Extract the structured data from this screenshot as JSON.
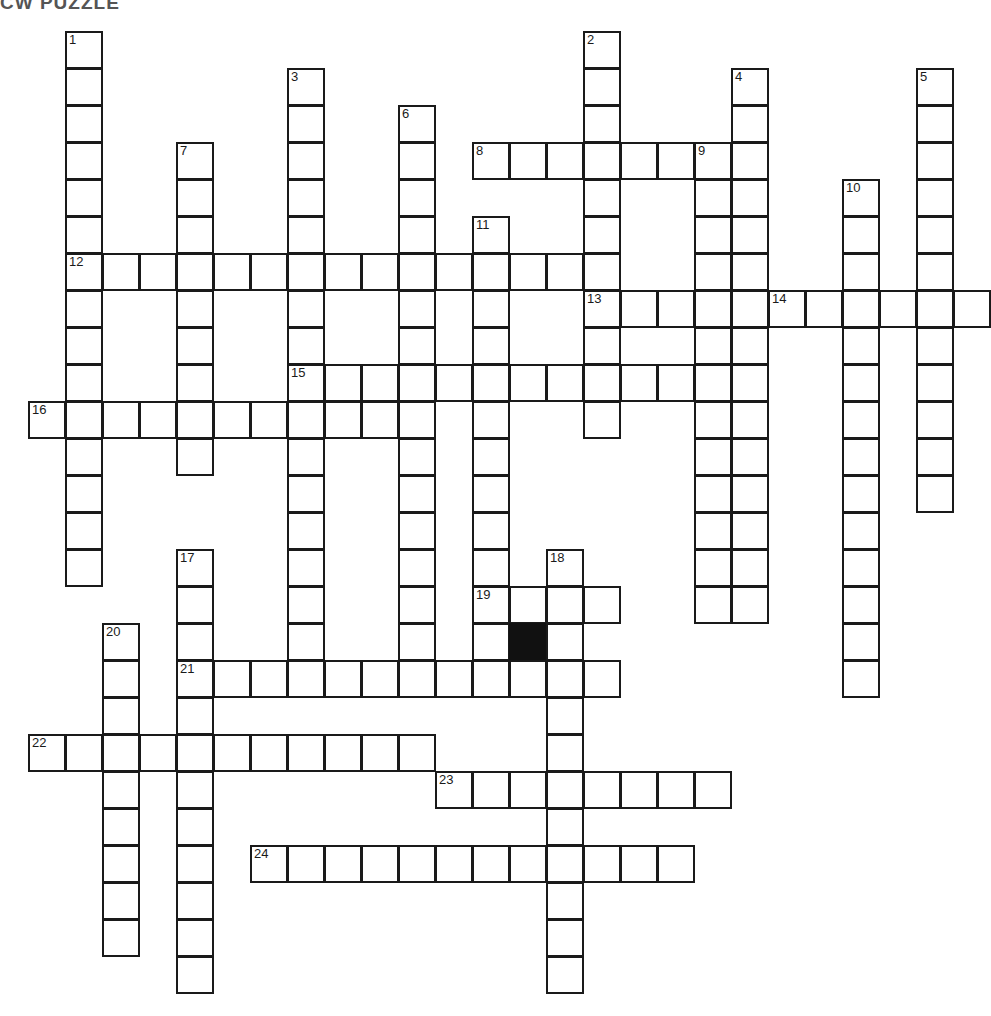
{
  "title": "CW PUZZLE",
  "grid": {
    "origin_x": 28,
    "origin_y": 31,
    "cell_size": 37,
    "cols": 26,
    "rows": 26,
    "border_color": "#1a1a1a",
    "cell_color": "#ffffff",
    "block_color": "#111111"
  },
  "numbers": [
    1,
    2,
    3,
    4,
    5,
    6,
    7,
    8,
    9,
    10,
    11,
    12,
    13,
    14,
    15,
    16,
    17,
    18,
    19,
    20,
    21,
    22,
    23,
    24
  ],
  "entries": [
    {
      "number": 1,
      "direction": "down",
      "col": 1,
      "row": 0,
      "length": 15
    },
    {
      "number": 2,
      "direction": "down",
      "col": 15,
      "row": 0,
      "length": 11
    },
    {
      "number": 3,
      "direction": "down",
      "col": 7,
      "row": 1,
      "length": 16
    },
    {
      "number": 4,
      "direction": "down",
      "col": 19,
      "row": 1,
      "length": 15
    },
    {
      "number": 5,
      "direction": "down",
      "col": 24,
      "row": 1,
      "length": 12
    },
    {
      "number": 6,
      "direction": "down",
      "col": 10,
      "row": 2,
      "length": 15
    },
    {
      "number": 7,
      "direction": "down",
      "col": 4,
      "row": 3,
      "length": 9
    },
    {
      "number": 8,
      "direction": "across",
      "col": 12,
      "row": 3,
      "length": 8
    },
    {
      "number": 9,
      "direction": "down",
      "col": 18,
      "row": 3,
      "length": 13
    },
    {
      "number": 10,
      "direction": "down",
      "col": 22,
      "row": 4,
      "length": 14
    },
    {
      "number": 11,
      "direction": "down",
      "col": 12,
      "row": 5,
      "length": 12
    },
    {
      "number": 12,
      "direction": "across",
      "col": 1,
      "row": 6,
      "length": 14
    },
    {
      "number": 13,
      "direction": "across",
      "col": 15,
      "row": 7,
      "length": 11
    },
    {
      "number": 14,
      "direction": "across",
      "col": 20,
      "row": 7,
      "length": 5
    },
    {
      "number": 15,
      "direction": "across",
      "col": 7,
      "row": 9,
      "length": 12
    },
    {
      "number": 16,
      "direction": "across",
      "col": 0,
      "row": 10,
      "length": 11
    },
    {
      "number": 17,
      "direction": "down",
      "col": 4,
      "row": 14,
      "length": 12
    },
    {
      "number": 18,
      "direction": "down",
      "col": 14,
      "row": 14,
      "length": 12
    },
    {
      "number": 19,
      "direction": "across",
      "col": 12,
      "row": 15,
      "length": 4
    },
    {
      "number": 20,
      "direction": "down",
      "col": 2,
      "row": 16,
      "length": 9
    },
    {
      "number": 21,
      "direction": "across",
      "col": 4,
      "row": 17,
      "length": 12
    },
    {
      "number": 22,
      "direction": "across",
      "col": 0,
      "row": 19,
      "length": 11
    },
    {
      "number": 23,
      "direction": "across",
      "col": 11,
      "row": 20,
      "length": 8
    },
    {
      "number": 24,
      "direction": "across",
      "col": 6,
      "row": 22,
      "length": 12
    }
  ],
  "blocks": [
    {
      "col": 13,
      "row": 16
    }
  ]
}
